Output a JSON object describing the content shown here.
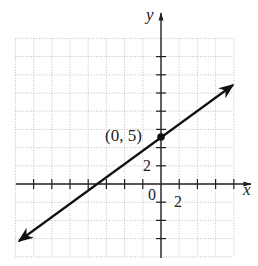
{
  "chart_data": {
    "type": "line",
    "title": "",
    "xlabel": "x",
    "ylabel": "y",
    "xlim": [
      -16,
      8
    ],
    "ylim": [
      -8,
      16
    ],
    "grid": true,
    "grid_step": 2,
    "tick_step": 2,
    "tick_labels": {
      "x": [
        "2"
      ],
      "y": [
        "2"
      ],
      "origin": "0"
    },
    "series": [
      {
        "name": "line",
        "equation": "y = (2/3)x + 5",
        "x": [
          -15,
          0,
          8
        ],
        "y": [
          -5,
          5,
          10.3
        ],
        "arrows": "both"
      }
    ],
    "annotations": [
      {
        "text": "(0, 5)",
        "x": 0,
        "y": 5,
        "marker": "filled-circle"
      }
    ]
  },
  "labels": {
    "x_axis": "x",
    "y_axis": "y",
    "origin": "0",
    "x_tick": "2",
    "y_tick": "2",
    "point": "(0, 5)"
  },
  "colors": {
    "axis": "#222222",
    "grid": "#b0b0b0",
    "line": "#111111"
  }
}
